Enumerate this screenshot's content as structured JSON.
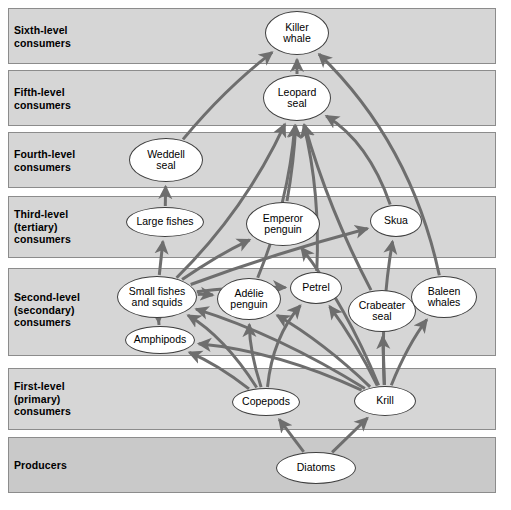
{
  "diagram": {
    "background": "#ffffff",
    "band_fill": "#d6d6d6",
    "band_stroke": "#8c8c8c",
    "arrow_color": "#6e6e6e",
    "node_fill": "#ffffff",
    "node_stroke": "#3f3f3f"
  },
  "bands": [
    {
      "id": "sixth",
      "label": "Sixth-level\nconsumers",
      "x": 8,
      "y": 8,
      "w": 488,
      "h": 56,
      "label_y": 24
    },
    {
      "id": "fifth",
      "label": "Fifth-level\nconsumers",
      "x": 8,
      "y": 70,
      "w": 488,
      "h": 56,
      "label_y": 86
    },
    {
      "id": "fourth",
      "label": "Fourth-level\nconsumers",
      "x": 8,
      "y": 132,
      "w": 488,
      "h": 56,
      "label_y": 148
    },
    {
      "id": "third",
      "label": "Third-level\n(tertiary)\nconsumers",
      "x": 8,
      "y": 196,
      "w": 488,
      "h": 62,
      "label_y": 208
    },
    {
      "id": "second",
      "label": "Second-level\n(secondary)\nconsumers",
      "x": 8,
      "y": 268,
      "w": 488,
      "h": 88,
      "label_y": 291
    },
    {
      "id": "first",
      "label": "First-level\n(primary)\nconsumers",
      "x": 8,
      "y": 368,
      "w": 488,
      "h": 62,
      "label_y": 380
    },
    {
      "id": "producers",
      "label": "Producers",
      "x": 8,
      "y": 437,
      "w": 488,
      "h": 56,
      "label_y": 459
    }
  ],
  "nodes": [
    {
      "id": "killer_whale",
      "label": "Killer\nwhale",
      "cx": 297,
      "cy": 33,
      "rx": 32,
      "ry": 22,
      "band": "sixth"
    },
    {
      "id": "leopard_seal",
      "label": "Leopard\nseal",
      "cx": 297,
      "cy": 98,
      "rx": 34,
      "ry": 23,
      "band": "fifth"
    },
    {
      "id": "weddell_seal",
      "label": "Weddell\nseal",
      "cx": 166,
      "cy": 160,
      "rx": 37,
      "ry": 22,
      "band": "fourth"
    },
    {
      "id": "large_fishes",
      "label": "Large fishes",
      "cx": 165,
      "cy": 222,
      "rx": 39,
      "ry": 15,
      "band": "third"
    },
    {
      "id": "emperor_penguin",
      "label": "Emperor\npenguin",
      "cx": 283,
      "cy": 224,
      "rx": 37,
      "ry": 22,
      "band": "third"
    },
    {
      "id": "skua",
      "label": "Skua",
      "cx": 396,
      "cy": 221,
      "rx": 26,
      "ry": 16,
      "band": "third"
    },
    {
      "id": "small_fishes",
      "label": "Small fishes\nand squids",
      "cx": 157,
      "cy": 297,
      "rx": 40,
      "ry": 21,
      "band": "second"
    },
    {
      "id": "amphipods",
      "label": "Amphipods",
      "cx": 160,
      "cy": 340,
      "rx": 35,
      "ry": 14,
      "band": "second"
    },
    {
      "id": "adelie_penguin",
      "label": "Adélie\npenguin",
      "cx": 249,
      "cy": 299,
      "rx": 32,
      "ry": 21,
      "band": "second"
    },
    {
      "id": "petrel",
      "label": "Petrel",
      "cx": 316,
      "cy": 288,
      "rx": 26,
      "ry": 16,
      "band": "second"
    },
    {
      "id": "crabeater_seal",
      "label": "Crabeater\nseal",
      "cx": 382,
      "cy": 311,
      "rx": 34,
      "ry": 21,
      "band": "second"
    },
    {
      "id": "baleen_whales",
      "label": "Baleen\nwhales",
      "cx": 444,
      "cy": 297,
      "rx": 33,
      "ry": 21,
      "band": "second"
    },
    {
      "id": "copepods",
      "label": "Copepods",
      "cx": 266,
      "cy": 402,
      "rx": 34,
      "ry": 14,
      "band": "first"
    },
    {
      "id": "krill",
      "label": "Krill",
      "cx": 385,
      "cy": 401,
      "rx": 31,
      "ry": 15,
      "band": "first"
    },
    {
      "id": "diatoms",
      "label": "Diatoms",
      "cx": 316,
      "cy": 468,
      "rx": 40,
      "ry": 16,
      "band": "producers"
    }
  ],
  "edges": [
    {
      "from": "diatoms",
      "to": "copepods",
      "bend": 0
    },
    {
      "from": "diatoms",
      "to": "krill",
      "bend": 0
    },
    {
      "from": "copepods",
      "to": "small_fishes",
      "bend": 18
    },
    {
      "from": "copepods",
      "to": "amphipods",
      "bend": 8
    },
    {
      "from": "copepods",
      "to": "adelie_penguin",
      "bend": -8
    },
    {
      "from": "copepods",
      "to": "petrel",
      "bend": -20
    },
    {
      "from": "krill",
      "to": "crabeater_seal",
      "bend": 0
    },
    {
      "from": "krill",
      "to": "baleen_whales",
      "bend": -8
    },
    {
      "from": "krill",
      "to": "petrel",
      "bend": 6
    },
    {
      "from": "krill",
      "to": "adelie_penguin",
      "bend": 10
    },
    {
      "from": "krill",
      "to": "small_fishes",
      "bend": 16
    },
    {
      "from": "krill",
      "to": "amphipods",
      "bend": 20
    },
    {
      "from": "krill",
      "to": "emperor_penguin",
      "bend": 14
    },
    {
      "from": "krill",
      "to": "skua",
      "bend": -10
    },
    {
      "from": "amphipods",
      "to": "small_fishes",
      "bend": 0
    },
    {
      "from": "small_fishes",
      "to": "large_fishes",
      "bend": 0
    },
    {
      "from": "small_fishes",
      "to": "emperor_penguin",
      "bend": -6
    },
    {
      "from": "small_fishes",
      "to": "adelie_penguin",
      "bend": -4
    },
    {
      "from": "small_fishes",
      "to": "petrel",
      "bend": -6
    },
    {
      "from": "small_fishes",
      "to": "skua",
      "bend": -6
    },
    {
      "from": "small_fishes",
      "to": "leopard_seal",
      "bend": 22
    },
    {
      "from": "large_fishes",
      "to": "weddell_seal",
      "bend": 0
    },
    {
      "from": "emperor_penguin",
      "to": "leopard_seal",
      "bend": 4
    },
    {
      "from": "adelie_penguin",
      "to": "leopard_seal",
      "bend": 16
    },
    {
      "from": "petrel",
      "to": "leopard_seal",
      "bend": 14
    },
    {
      "from": "skua",
      "to": "leopard_seal",
      "bend": 28
    },
    {
      "from": "weddell_seal",
      "to": "killer_whale",
      "bend": -10
    },
    {
      "from": "leopard_seal",
      "to": "killer_whale",
      "bend": 0
    },
    {
      "from": "baleen_whales",
      "to": "killer_whale",
      "bend": 46
    },
    {
      "from": "crabeater_seal",
      "to": "leopard_seal",
      "bend": -12
    }
  ]
}
